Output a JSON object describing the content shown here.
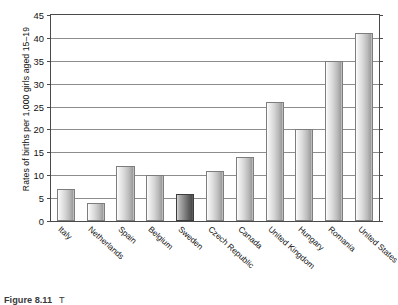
{
  "chart_data": {
    "type": "bar",
    "title": "",
    "xlabel": "",
    "ylabel": "Rates of births per 1,000 girls aged 15–19",
    "ylim": [
      0,
      45
    ],
    "ytick_step": 5,
    "yticks": [
      "45",
      "40",
      "35",
      "30",
      "25",
      "20",
      "15",
      "10",
      "5",
      "0"
    ],
    "grid": true,
    "legend": "none",
    "categories": [
      "Italy",
      "Netherlands",
      "Spain",
      "Belgium",
      "Sweden",
      "Czech Republic",
      "Canada",
      "United Kingdom",
      "Hungary",
      "Romania",
      "United States"
    ],
    "values": [
      7,
      4,
      12,
      10,
      6,
      11,
      14,
      26,
      20,
      35,
      41
    ],
    "highlighted_category": "Sweden",
    "bar_fill": "#c8c8c8",
    "bar_fill_highlight": "#6a6a6a",
    "bar_edge": "#7d7d7d",
    "grid_color": "#8d8d8d",
    "axis_color": "#4a4a4a"
  },
  "caption": {
    "number": "Figure 8.11",
    "text": "T"
  }
}
